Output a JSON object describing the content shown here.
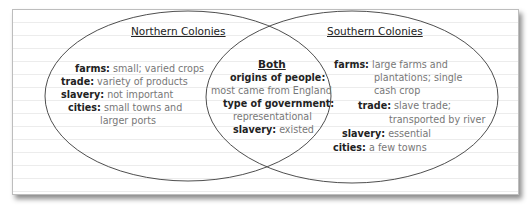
{
  "diagram": {
    "type": "venn",
    "sets": [
      {
        "title": "Northern Colonies",
        "items": [
          {
            "label": "farms:",
            "value": "small; varied crops"
          },
          {
            "label": "trade:",
            "value": "variety of products"
          },
          {
            "label": "slavery:",
            "value": "not important"
          },
          {
            "label": "cities:",
            "value": "small towns and",
            "continuation": "larger ports"
          }
        ]
      },
      {
        "title": "Both",
        "items": [
          {
            "label": "origins of people:",
            "value": "most came from England"
          },
          {
            "label": "type of government:",
            "value": "representational"
          },
          {
            "label": "slavery:",
            "value": "existed"
          }
        ]
      },
      {
        "title": "Southern Colonies",
        "items": [
          {
            "label": "farms:",
            "value": "large farms and",
            "continuation": [
              "plantations; single",
              "cash crop"
            ]
          },
          {
            "label": "trade:",
            "value": "slave trade;",
            "continuation": "transported by river"
          },
          {
            "label": "slavery:",
            "value": "essential"
          },
          {
            "label": "cities:",
            "value": "a few towns"
          }
        ]
      }
    ],
    "colors": {
      "outline": "#333333",
      "label": "#222222",
      "value": "#777777",
      "rule": "#ececec"
    }
  }
}
